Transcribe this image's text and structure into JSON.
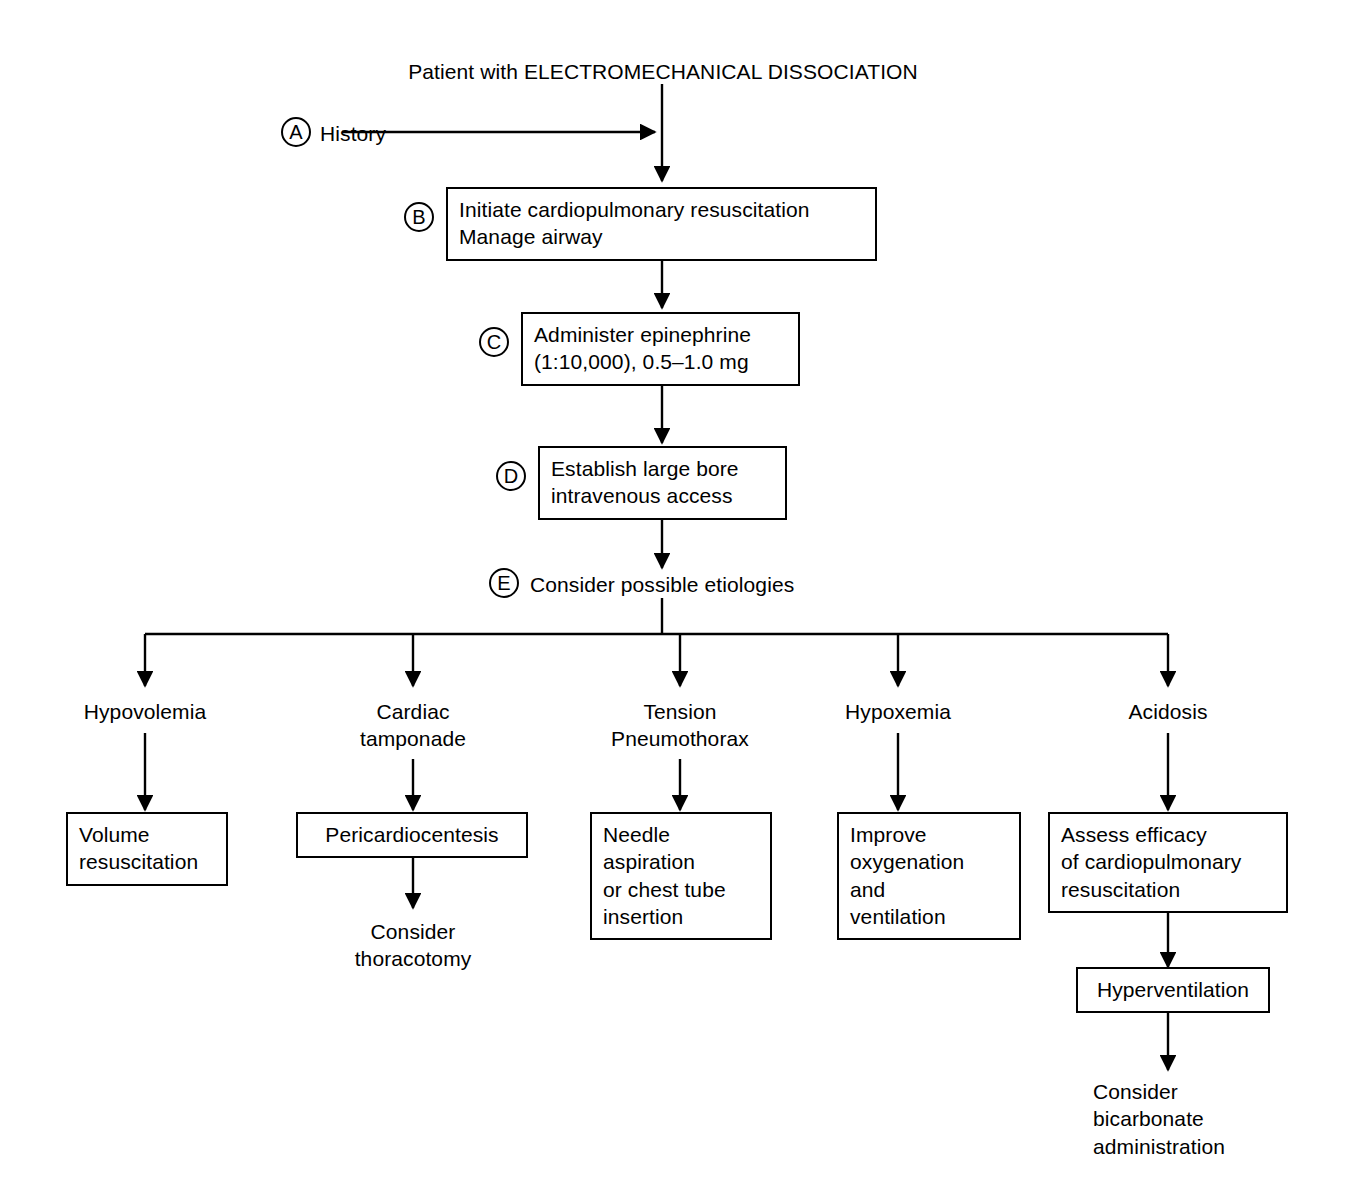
{
  "figure": {
    "title": "Patient with ELECTROMECHANICAL DISSOCIATION",
    "ink_color": "#000000",
    "background_color": "#ffffff"
  },
  "steps": {
    "a": {
      "marker": "A",
      "label": "History"
    },
    "b": {
      "marker": "B",
      "label": "Initiate cardiopulmonary resuscitation\nManage airway"
    },
    "c": {
      "marker": "C",
      "label": "Administer epinephrine\n(1:10,000), 0.5–1.0 mg"
    },
    "d": {
      "marker": "D",
      "label": "Establish large bore\nintravenous access"
    },
    "e": {
      "marker": "E",
      "label": "Consider possible etiologies"
    }
  },
  "branches": [
    {
      "etiology": "Hypovolemia",
      "treatment": "Volume\nresuscitation",
      "followup": null
    },
    {
      "etiology": "Cardiac\ntamponade",
      "treatment": "Pericardiocentesis",
      "followup": "Consider\nthoracotomy"
    },
    {
      "etiology": "Tension\nPneumothorax",
      "treatment": "Needle\naspiration\nor chest tube\ninsertion",
      "followup": null
    },
    {
      "etiology": "Hypoxemia",
      "treatment": "Improve\noxygenation\nand\nventilation",
      "followup": null
    },
    {
      "etiology": "Acidosis",
      "treatment": "Assess efficacy\nof cardiopulmonary\nresuscitation",
      "secondary": "Hyperventilation",
      "followup": "Consider\nbicarbonate\nadministration"
    }
  ]
}
